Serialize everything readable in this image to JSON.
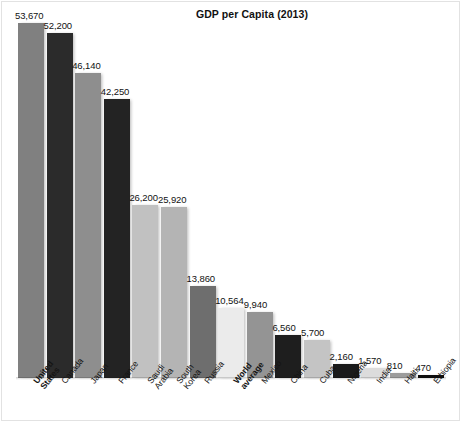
{
  "chart_data": {
    "type": "bar",
    "title": "GDP per Capita (2013)",
    "xlabel": "",
    "ylabel": "",
    "ylim": [
      0,
      53670
    ],
    "grid": false,
    "legend": "none",
    "categories": [
      "United States",
      "Canada",
      "Japan",
      "France",
      "Saudi Arabia",
      "South Korea",
      "Russia",
      "World average",
      "Mexico",
      "China",
      "Cuba",
      "Nigeria",
      "India",
      "Haiti",
      "Ethiopia"
    ],
    "values": [
      53670,
      52200,
      46140,
      42250,
      26200,
      25920,
      13860,
      10564,
      9940,
      6560,
      5700,
      2160,
      1570,
      810,
      470
    ],
    "value_labels": [
      "53,670",
      "52,200",
      "46,140",
      "42,250",
      "26,200",
      "25,920",
      "13,860",
      "10,564",
      "9,940",
      "6,560",
      "5,700",
      "2,160",
      "1,570",
      "810",
      "470"
    ],
    "bar_colors": [
      "#808080",
      "#2b2b2b",
      "#8e8e8e",
      "#232323",
      "#c1c1c1",
      "#b4b4b4",
      "#6e6e6e",
      "#ebebeb",
      "#949494",
      "#1e1e1e",
      "#c4c4c4",
      "#1a1a1a",
      "#dcdcdc",
      "#9c9c9c",
      "#0d0d0d"
    ],
    "emphasized_categories": [
      "United States",
      "World average"
    ],
    "category_label_lines": [
      "United\nStates",
      "Canada",
      "Japan",
      "France",
      "Saudi\nArabia",
      "South\nKorea",
      "Russia",
      "World\naverage",
      "Mexico",
      "China",
      "Cuba",
      "Nigeria",
      "India",
      "Haiti",
      "Ethiopia"
    ]
  }
}
